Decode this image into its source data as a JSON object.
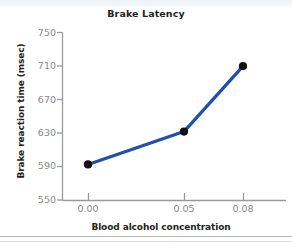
{
  "chart_data": {
    "type": "line",
    "title": "Brake Latency",
    "xlabel": "Blood alcohol concentration",
    "ylabel": "Brake reaction time (msec)",
    "x": [
      0.0,
      0.05,
      0.08
    ],
    "xtick_labels": [
      "0.00",
      "0.05",
      "0.08"
    ],
    "values": [
      593,
      632,
      710
    ],
    "ytick_labels": [
      "750",
      "710",
      "670",
      "630",
      "590",
      "550"
    ],
    "yticks": [
      750,
      710,
      670,
      630,
      590,
      550
    ],
    "ylim": [
      550,
      750
    ],
    "grid": false,
    "legend": null,
    "series": [
      {
        "name": "Brake reaction time",
        "values": [
          593,
          632,
          710
        ]
      }
    ],
    "line_color": "#1f4fb5",
    "marker_color": "#101010",
    "axis_color": "#9a9a9a",
    "tick_label_color": "#8a8a8a",
    "text_color": "#231f20"
  }
}
